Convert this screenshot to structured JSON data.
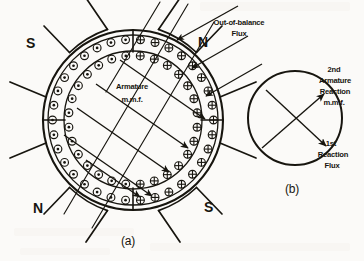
{
  "figure": {
    "background_color": "#fbfaf8",
    "ink_color": "#17150f"
  },
  "panel_a": {
    "caption": "(a)",
    "center_label_line1": "Armature",
    "center_label_line2": "m.m.f.",
    "flux_label_line1": "Out-of-balance",
    "flux_label_line2": "Flux",
    "poles": [
      {
        "name": "pole-top-left",
        "letter": "S"
      },
      {
        "name": "pole-top-right",
        "letter": "N"
      },
      {
        "name": "pole-bottom-left",
        "letter": "N"
      },
      {
        "name": "pole-bottom-right",
        "letter": "S"
      }
    ],
    "conductor_symbols": {
      "dot": "current out of page",
      "cross": "current into page"
    }
  },
  "panel_b": {
    "caption": "(b)",
    "label_2nd_line1": "2nd",
    "label_2nd_line2": "Armature",
    "label_2nd_line3": "Reaction",
    "label_2nd_line4": "m.m.f.",
    "label_1st_line1": "1st",
    "label_1st_line2": "Reaction",
    "label_1st_line3": "Flux"
  },
  "chart_data": {
    "type": "diagram",
    "panels": [
      {
        "id": "a",
        "caption": "(a)",
        "armature_center": [
          133,
          120
        ],
        "armature_outer_radius": 90,
        "armature_inner_radius": 70,
        "conductor_ring_outer_radius": 82,
        "conductor_ring_inner_radius": 72,
        "pole_arc_radius": 103,
        "pole_letters": [
          "S",
          "N",
          "N",
          "S"
        ],
        "pole_angles_deg": [
          225,
          315,
          135,
          45
        ],
        "mmf_arrow_direction_deg": 35,
        "mmf_arrow_count": 5,
        "flux_arrow_direction_deg": 215,
        "flux_arrow_count": 3,
        "brush_axis_marks_deg": [
          90,
          0,
          270,
          180
        ]
      },
      {
        "id": "b",
        "caption": "(b)",
        "circle_center": [
          295,
          118
        ],
        "circle_radius": 47,
        "arrows": [
          {
            "label": "2nd Armature Reaction m.m.f.",
            "direction_deg": 35
          },
          {
            "label": "1st Reaction Flux",
            "direction_deg": -40
          }
        ]
      }
    ]
  }
}
